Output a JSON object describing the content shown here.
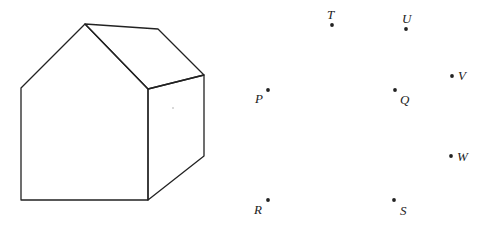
{
  "figure": {
    "house": {
      "vertices": {
        "apex": [
          85,
          24
        ],
        "roof_back": [
          158,
          29
        ],
        "roof_right": [
          204,
          75
        ],
        "front_top_right": [
          148,
          89
        ],
        "left_eave": [
          21,
          88
        ],
        "bottom_left": [
          21,
          200
        ],
        "bottom_front_right": [
          148,
          200
        ],
        "bottom_back_right": [
          204,
          156
        ]
      },
      "stroke": "#222222"
    },
    "points": [
      {
        "label": "T",
        "dot": [
          332,
          25
        ],
        "text": [
          327,
          19
        ]
      },
      {
        "label": "U",
        "dot": [
          406,
          29
        ],
        "text": [
          402,
          23
        ]
      },
      {
        "label": "V",
        "dot": [
          452,
          76
        ],
        "text": [
          458,
          80
        ]
      },
      {
        "label": "P",
        "dot": [
          268,
          90
        ],
        "text": [
          255,
          103
        ]
      },
      {
        "label": "Q",
        "dot": [
          395,
          90
        ],
        "text": [
          400,
          104
        ]
      },
      {
        "label": "W",
        "dot": [
          451,
          156
        ],
        "text": [
          457,
          161
        ]
      },
      {
        "label": "R",
        "dot": [
          268,
          200
        ],
        "text": [
          254,
          214
        ]
      },
      {
        "label": "S",
        "dot": [
          394,
          200
        ],
        "text": [
          400,
          215
        ]
      }
    ]
  }
}
